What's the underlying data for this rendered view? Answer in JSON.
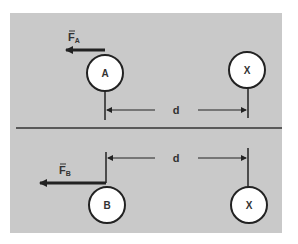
{
  "diagram": {
    "top": {
      "force_label": "F",
      "force_subscript": "A",
      "object_label": "A",
      "other_label": "X",
      "distance_label": "d"
    },
    "bottom": {
      "force_label": "F",
      "force_subscript": "B",
      "object_label": "B",
      "other_label": "X",
      "distance_label": "d"
    },
    "colors": {
      "panel": "#c9c9c9",
      "ink": "#222222",
      "circle_fill": "#ffffff"
    }
  }
}
